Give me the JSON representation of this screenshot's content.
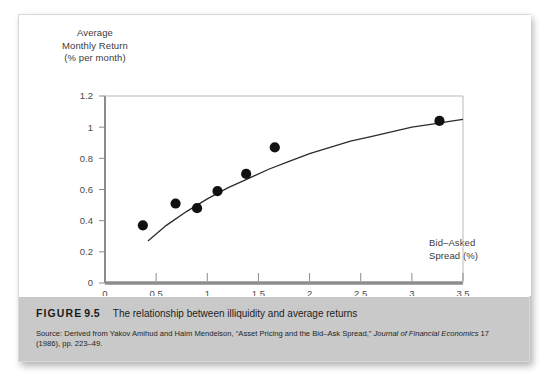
{
  "figure": {
    "label_word": "FIGURE",
    "number": "9.5",
    "caption": "The relationship between illiquidity and average returns",
    "source_prefix": "Source:",
    "source_text_1": " Derived from Yakov Amihud and Haim Mendelson, “Asset Pricing and the Bid–Ask Spread,” ",
    "source_italic_1": "Journal of Financial Economics",
    "source_text_2": " 17 (1986), pp. 223–49."
  },
  "colors": {
    "band_background": "#c9c9c9",
    "card_background": "#ffffff",
    "axis": "#6e6e6e",
    "point": "#111111",
    "curve": "#2b2b2b",
    "tick_text": "#4a4a4a"
  },
  "chart_data": {
    "type": "scatter",
    "title": "",
    "xlabel": "Bid–Asked Spread (%)",
    "ylabel": "Average Monthly Return (% per month)",
    "ylabel_lines": [
      "Average",
      "Monthly Return",
      "(% per month)"
    ],
    "xlabel_lines": [
      "Bid–Asked",
      "Spread (%)"
    ],
    "xlim": [
      0,
      3.5
    ],
    "ylim": [
      0,
      1.2
    ],
    "xticks": [
      "0",
      "0.5",
      "1",
      "1.5",
      "2",
      "2.5",
      "3",
      "3.5"
    ],
    "xtick_values": [
      0,
      0.5,
      1,
      1.5,
      2,
      2.5,
      3,
      3.5
    ],
    "yticks": [
      "0",
      "0.2",
      "0.4",
      "0.6",
      "0.8",
      "1",
      "1.2"
    ],
    "ytick_values": [
      0,
      0.2,
      0.4,
      0.6,
      0.8,
      1,
      1.2
    ],
    "grid": false,
    "legend": null,
    "points": [
      {
        "x": 0.37,
        "y": 0.37
      },
      {
        "x": 0.69,
        "y": 0.51
      },
      {
        "x": 0.9,
        "y": 0.48
      },
      {
        "x": 1.1,
        "y": 0.59
      },
      {
        "x": 1.38,
        "y": 0.7
      },
      {
        "x": 1.66,
        "y": 0.87
      },
      {
        "x": 3.27,
        "y": 1.04
      }
    ],
    "fit_curve": {
      "name": "fitted concave trend",
      "x": [
        0.42,
        0.6,
        0.8,
        1.0,
        1.2,
        1.4,
        1.6,
        1.8,
        2.0,
        2.2,
        2.4,
        2.6,
        2.8,
        3.0,
        3.2,
        3.4,
        3.5
      ],
      "y": [
        0.27,
        0.37,
        0.46,
        0.54,
        0.61,
        0.67,
        0.73,
        0.78,
        0.83,
        0.87,
        0.91,
        0.94,
        0.97,
        1.0,
        1.02,
        1.04,
        1.05
      ]
    }
  }
}
